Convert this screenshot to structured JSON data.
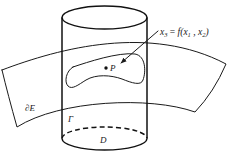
{
  "figure": {
    "labels": {
      "equation": {
        "lhs_var": "x",
        "lhs_sub": "3",
        "equals": " = ",
        "func_open": "f(",
        "arg1_var": "x",
        "arg1_sub": "1",
        "separator": " , ",
        "arg2_var": "x",
        "arg2_sub": "2",
        "close": ")"
      },
      "point": "P",
      "boundary": "∂E",
      "curve": "Γ",
      "domain": "D"
    },
    "elements": {
      "cylinder": "vertical cylinder over domain D",
      "surface": "curved surface patch ∂E",
      "region": "closed region on surface containing point P",
      "arrow": "pointer from equation label to region"
    },
    "colors": {
      "stroke": "#1a1a1a",
      "background": "#ffffff"
    }
  }
}
